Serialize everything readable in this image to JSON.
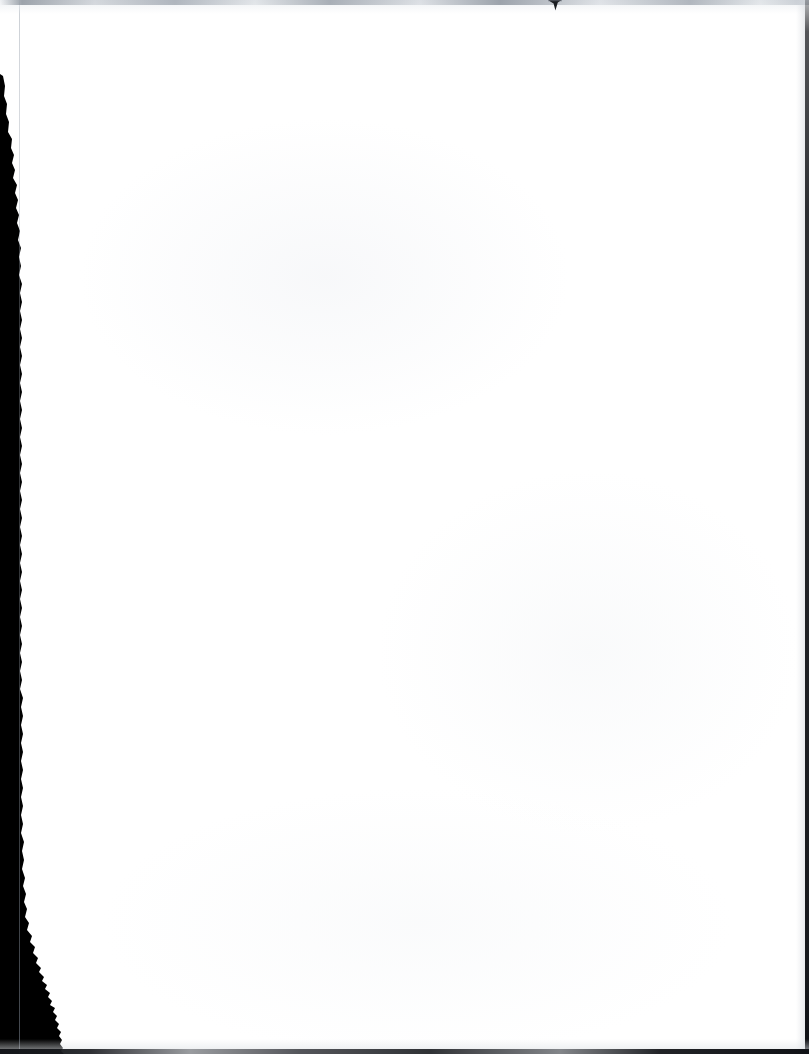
{
  "document": {
    "kind": "scanned-page",
    "content_text": "",
    "page_state_label": "Blank page",
    "width_px": 809,
    "height_px": 1054
  },
  "colors": {
    "paper": "#ffffff",
    "scan_band": "#000000",
    "edge_dark": "#16181c",
    "edge_gray": "#8f97a1",
    "scan_line": "#a0a8b2"
  },
  "artifacts": {
    "left_band": {
      "name": "left-scanner-shadow-band",
      "description": "Solid black scanner edge along the left margin",
      "top_y": 75,
      "width_at_top_px": 0,
      "width_at_middle_px": 20,
      "width_at_bottom_px": 62
    },
    "scan_line": {
      "name": "vertical-scan-line",
      "description": "Faint vertical line running the full page height",
      "x_px": 19
    },
    "top_edge": {
      "name": "top-edge-smudge",
      "description": "Light gray smudge along the top edge",
      "height_px": 5
    },
    "top_notch": {
      "name": "top-edge-notch",
      "description": "Small dark triangular notch at the top edge",
      "x_px": 548,
      "width_px": 14,
      "height_px": 11
    },
    "right_edge": {
      "name": "right-edge-line",
      "description": "Thin dark line along the right edge",
      "width_px": 4
    },
    "bottom_edge": {
      "name": "bottom-edge-line",
      "description": "Thin dark line along the bottom edge",
      "height_px": 5
    }
  }
}
